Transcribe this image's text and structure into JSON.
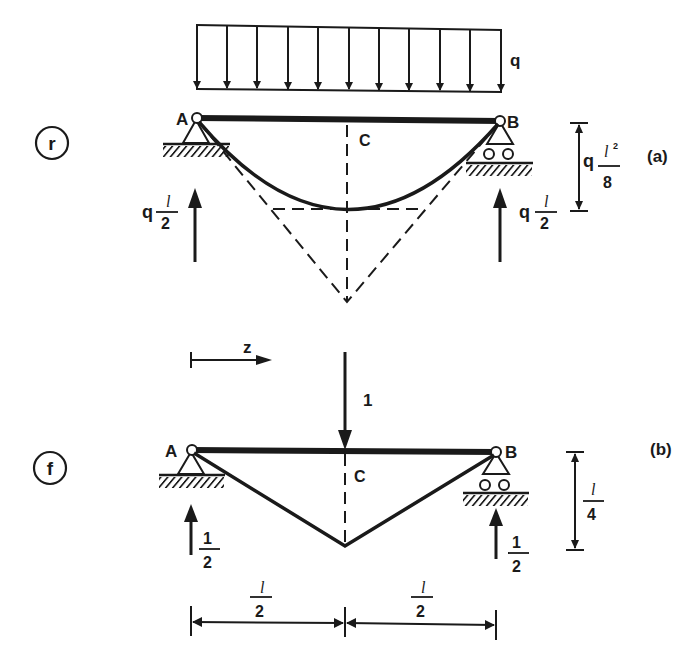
{
  "diagram": {
    "type": "structural-beam-diagram",
    "colors": {
      "ink": "#1a1a1a",
      "background": "#ffffff"
    },
    "panel_a": {
      "marker": "r",
      "caption": "(a)",
      "load_label": "q",
      "load_arrow_count": 11,
      "node_left": "A",
      "node_right": "B",
      "midpoint": "C",
      "reaction_left": {
        "coef": "q",
        "num": "l",
        "den": "2"
      },
      "reaction_right": {
        "coef": "q",
        "num": "l",
        "den": "2"
      },
      "max_moment": {
        "coef": "q",
        "num": "l",
        "exp": "2",
        "den": "8"
      },
      "curve": "parabolic moment diagram with dashed tangent triangle"
    },
    "panel_b": {
      "marker": "f",
      "caption": "(b)",
      "point_load": "1",
      "coordinate": "z",
      "node_left": "A",
      "node_right": "B",
      "midpoint": "C",
      "reaction_left": {
        "num": "1",
        "den": "2"
      },
      "reaction_right": {
        "num": "1",
        "den": "2"
      },
      "max_moment": {
        "num": "l",
        "den": "4"
      },
      "span_left": {
        "num": "l",
        "den": "2"
      },
      "span_right": {
        "num": "l",
        "den": "2"
      }
    }
  }
}
